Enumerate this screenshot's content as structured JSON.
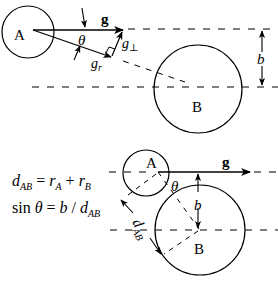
{
  "top_panel": {
    "circle_a_label": "A",
    "circle_b_label": "B",
    "vector_g_label": "g",
    "angle_label": "θ",
    "vector_gr_main": "g",
    "vector_gr_sub": "r",
    "vector_gperp_main": "g",
    "vector_gperp_sub": "⊥",
    "impact_parameter_label": "b"
  },
  "bottom_panel": {
    "circle_a_label": "A",
    "circle_b_label": "B",
    "vector_g_label": "g",
    "angle_label": "θ",
    "impact_parameter_label": "b",
    "distance_main": "d",
    "distance_sub": "AB"
  },
  "equations": {
    "eq1": {
      "lhs_main": "d",
      "lhs_sub": "AB",
      "eq": " = ",
      "t1_main": "r",
      "t1_sub": "A",
      "plus": " + ",
      "t2_main": "r",
      "t2_sub": "B"
    },
    "eq2": {
      "sin": "sin ",
      "theta": "θ",
      "eq": " = ",
      "b": "b",
      "slash": " / ",
      "d_main": "d",
      "d_sub": "AB"
    }
  },
  "colors": {
    "stroke": "#000000",
    "background": "#ffffff"
  }
}
